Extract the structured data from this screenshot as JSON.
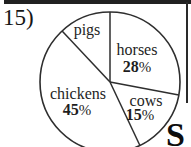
{
  "problem_number": "15)",
  "watermark_letter": "S",
  "colors": {
    "ink": "#1e1e1e",
    "line": "#2e2e2e",
    "background": "#ffffff"
  },
  "chart_data": {
    "type": "pie",
    "title": "",
    "categories": [
      "horses",
      "cows",
      "chickens",
      "pigs"
    ],
    "values": [
      28,
      15,
      45,
      12
    ],
    "unit": "%",
    "start_angle_deg": 0,
    "direction": "clockwise",
    "legend": "none",
    "fill": "white",
    "slice_labels": {
      "pigs": {
        "name": "pigs",
        "percent_number": "",
        "percent_sign": ""
      },
      "horses": {
        "name": "horses",
        "percent_number": "28",
        "percent_sign": "%"
      },
      "cows": {
        "name": "cows",
        "percent_number": "15",
        "percent_sign": "%"
      },
      "chickens": {
        "name": "chickens",
        "percent_number": "45",
        "percent_sign": "%"
      }
    }
  }
}
